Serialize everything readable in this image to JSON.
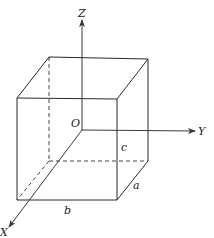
{
  "diagram": {
    "type": "3d-rectangular-box-with-coordinate-axes",
    "axes": {
      "z_label": "Z",
      "y_label": "Y",
      "x_label": "X",
      "origin_label": "O"
    },
    "dimensions": {
      "a_label": "a",
      "b_label": "b",
      "c_label": "c"
    },
    "colors": {
      "line": "#2a2a2a",
      "background": "#ffffff"
    }
  }
}
